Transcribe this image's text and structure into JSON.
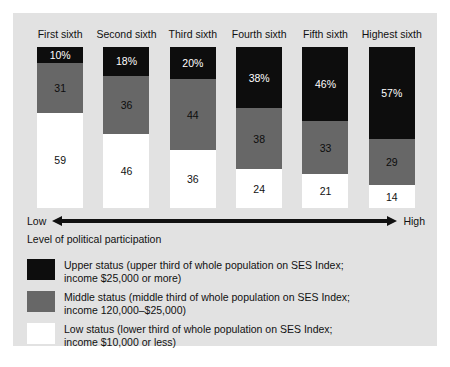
{
  "chart_data": {
    "type": "bar",
    "title": "",
    "subtitle": "",
    "xlabel": "Level of political participation",
    "ylabel": "",
    "stacked": true,
    "normalized_percent": true,
    "ylim": [
      0,
      100
    ],
    "grid": false,
    "legend_position": "bottom-left",
    "categories": [
      "First sixth",
      "Second sixth",
      "Third sixth",
      "Fourth sixth",
      "Fifth sixth",
      "Highest sixth"
    ],
    "series": [
      {
        "name": "Upper status",
        "color": "#0d0d0d",
        "values": [
          10,
          18,
          20,
          38,
          46,
          57
        ],
        "labels": [
          "10%",
          "18%",
          "20%",
          "38%",
          "46%",
          "57%"
        ]
      },
      {
        "name": "Middle status",
        "color": "#676767",
        "values": [
          31,
          36,
          44,
          38,
          33,
          29
        ],
        "labels": [
          "31",
          "36",
          "44",
          "38",
          "33",
          "29"
        ]
      },
      {
        "name": "Low status",
        "color": "#ffffff",
        "values": [
          59,
          46,
          36,
          24,
          21,
          14
        ],
        "labels": [
          "59",
          "46",
          "36",
          "24",
          "21",
          "14"
        ]
      }
    ],
    "annotations": {
      "axis_low": "Low",
      "axis_high": "High"
    }
  },
  "axis": {
    "low": "Low",
    "high": "High",
    "caption": "Level of political participation"
  },
  "legend": {
    "items": [
      {
        "swatch": "upper",
        "line1": "Upper status (upper third of whole population on SES Index;",
        "line2": "income $25,000 or more)"
      },
      {
        "swatch": "middle",
        "line1": "Middle status (middle third of whole population on SES Index;",
        "line2": "income 120,000–$25,000)"
      },
      {
        "swatch": "low",
        "line1": "Low status (lower third of whole population on SES Index;",
        "line2": "income $10,000 or less)"
      }
    ]
  },
  "colors": {
    "panel_background": "#e2e2e2",
    "page_background": "#ffffff",
    "upper_status": "#0d0d0d",
    "middle_status": "#676767",
    "low_status": "#ffffff",
    "text": "#111111"
  }
}
